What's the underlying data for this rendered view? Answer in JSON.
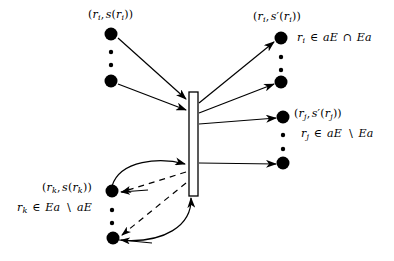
{
  "diagram": {
    "type": "node-mapping-diagram",
    "background_color": "#ffffff",
    "stroke_color": "#000000",
    "labels": {
      "top_left": "(r_i, s(r_i))",
      "top_right": "(r_i, s'(r_i))",
      "top_right_condition": "r_i ∈ aE ∩ Ea",
      "mid_right": "(r_j, s'(r_j))",
      "mid_right_condition": "r_j ∈ aE \\ Ea",
      "bottom_left": "(r_k, s(r_k))",
      "bottom_left_condition": "r_k ∈ Ea \\ aE"
    },
    "parts": {
      "top_left_pair": {
        "var": "r",
        "var_sub": "i",
        "fn": "s"
      },
      "top_right_pair": {
        "var": "r",
        "var_sub": "i",
        "fn": "s",
        "prime": "′"
      },
      "mid_right_pair": {
        "var": "r",
        "var_sub": "j",
        "fn": "s",
        "prime": "′"
      },
      "bottom_left_pair": {
        "var": "r",
        "var_sub": "k",
        "fn": "s"
      },
      "cond_i": {
        "var": "r",
        "sub": "i",
        "member": "∈",
        "left": "aE",
        "op": "∩",
        "right": "Ea"
      },
      "cond_j": {
        "var": "r",
        "sub": "j",
        "member": "∈",
        "left": "aE",
        "op": "∖",
        "right": "Ea"
      },
      "cond_k": {
        "var": "r",
        "sub": "k",
        "member": "∈",
        "left": "Ea",
        "op": "∖",
        "right": "aE"
      }
    },
    "central_bar": {
      "name": "vertical-bar",
      "x": 189,
      "y": 92,
      "width": 9,
      "height": 104,
      "fill": "#ffffff"
    },
    "nodes": {
      "big_radius": 6.5,
      "small_radius": 2.2,
      "top_left_column": [
        {
          "x": 111,
          "y": 34,
          "size": "big"
        },
        {
          "x": 111,
          "y": 52,
          "size": "small"
        },
        {
          "x": 111,
          "y": 65,
          "size": "small"
        },
        {
          "x": 111,
          "y": 81,
          "size": "big"
        }
      ],
      "bottom_left_column": [
        {
          "x": 112,
          "y": 191,
          "size": "big"
        },
        {
          "x": 112,
          "y": 210,
          "size": "small"
        },
        {
          "x": 112,
          "y": 223,
          "size": "small"
        },
        {
          "x": 113,
          "y": 238,
          "size": "big"
        }
      ],
      "top_right_column": [
        {
          "x": 281,
          "y": 38,
          "size": "big"
        },
        {
          "x": 281,
          "y": 57,
          "size": "small"
        },
        {
          "x": 281,
          "y": 70,
          "size": "small"
        },
        {
          "x": 281,
          "y": 82,
          "size": "big"
        }
      ],
      "bottom_right_column": [
        {
          "x": 283,
          "y": 117,
          "size": "big"
        },
        {
          "x": 283,
          "y": 135,
          "size": "small"
        },
        {
          "x": 283,
          "y": 149,
          "size": "small"
        },
        {
          "x": 283,
          "y": 163,
          "size": "big"
        }
      ]
    },
    "edges": {
      "incoming_solid_count": 2,
      "outgoing_solid_count": 4,
      "curved_solid_count": 2,
      "dashed_count": 2
    }
  }
}
